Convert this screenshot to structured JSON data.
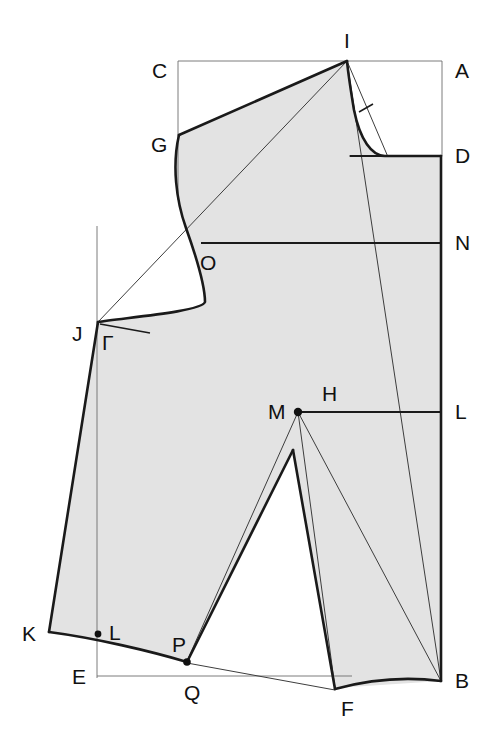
{
  "diagram": {
    "type": "technical-pattern-draft",
    "canvas": {
      "width": 493,
      "height": 741
    },
    "colors": {
      "body_fill": "#e3e3e3",
      "outline": "#1a1a1a",
      "guide": "#6e6e6e",
      "construction": "#3d3d3d",
      "background": "#ffffff"
    },
    "points": [
      {
        "id": "A",
        "label": "A",
        "x": 442,
        "y": 61,
        "label_x": 455,
        "label_y": 78,
        "dot": false
      },
      {
        "id": "B",
        "label": "B",
        "x": 441,
        "y": 681,
        "label_x": 455,
        "label_y": 688,
        "dot": false
      },
      {
        "id": "C",
        "label": "C",
        "x": 178,
        "y": 61,
        "label_x": 152,
        "label_y": 78,
        "dot": false
      },
      {
        "id": "D",
        "label": "D",
        "x": 441,
        "y": 156,
        "label_x": 455,
        "label_y": 163,
        "dot": false
      },
      {
        "id": "E",
        "label": "E",
        "x": 97,
        "y": 676,
        "label_x": 72,
        "label_y": 684,
        "dot": false
      },
      {
        "id": "F",
        "label": "F",
        "x": 335,
        "y": 690,
        "label_x": 341,
        "label_y": 716,
        "dot": false
      },
      {
        "id": "G",
        "label": "G",
        "x": 179,
        "y": 135,
        "label_x": 151,
        "label_y": 152,
        "dot": false
      },
      {
        "id": "H",
        "label": "H",
        "x": 330,
        "y": 394,
        "label_x": 322,
        "label_y": 401,
        "dot": false
      },
      {
        "id": "I",
        "label": "I",
        "x": 347,
        "y": 61,
        "label_x": 344,
        "label_y": 48,
        "dot": false
      },
      {
        "id": "J",
        "label": "J",
        "x": 98,
        "y": 322,
        "label_x": 72,
        "label_y": 341,
        "dot": false
      },
      {
        "id": "K",
        "label": "K",
        "x": 49,
        "y": 632,
        "label_x": 22,
        "label_y": 641,
        "dot": false
      },
      {
        "id": "L_right",
        "label": "L",
        "x": 441,
        "y": 412,
        "label_x": 455,
        "label_y": 419,
        "dot": false
      },
      {
        "id": "L_hem",
        "label": "L",
        "x": 98,
        "y": 634,
        "label_x": 109,
        "label_y": 638,
        "dot": true
      },
      {
        "id": "M",
        "label": "M",
        "x": 298,
        "y": 412,
        "label_x": 268,
        "label_y": 419,
        "dot": true
      },
      {
        "id": "N",
        "label": "N",
        "x": 441,
        "y": 243,
        "label_x": 455,
        "label_y": 250,
        "dot": false
      },
      {
        "id": "O",
        "label": "O",
        "x": 207,
        "y": 255,
        "label_x": 207,
        "label_y": 271,
        "dot": false
      },
      {
        "id": "P",
        "label": "P",
        "x": 187,
        "y": 661,
        "label_x": 174,
        "label_y": 650,
        "dot": true
      },
      {
        "id": "Q",
        "label": "Q",
        "x": 193,
        "y": 676,
        "label_x": 186,
        "label_y": 700,
        "dot": false
      }
    ],
    "angle_markers": [
      {
        "id": "right-angle-at-J",
        "label": "Γ",
        "x": 104,
        "y": 348
      }
    ],
    "construction_lines": [
      {
        "id": "frame-top",
        "from": "C",
        "to": "A"
      },
      {
        "id": "frame-left-C-G",
        "from": "C",
        "to": "G-extended"
      },
      {
        "id": "frame-right-A-D",
        "from": "A",
        "to": "D"
      },
      {
        "id": "vertical-guide-J",
        "from": "above-J",
        "to": "E"
      },
      {
        "id": "baseline-E-F",
        "from": "E",
        "to": "F"
      },
      {
        "id": "diagonal-J-I",
        "from": "J",
        "to": "I"
      },
      {
        "id": "diagonal-I-B",
        "from": "I",
        "to": "B"
      },
      {
        "id": "diagonal-M-B",
        "from": "M",
        "to": "B"
      },
      {
        "id": "dart-guide-M-P",
        "from": "M",
        "to": "P"
      },
      {
        "id": "dart-guide-M-F",
        "from": "M",
        "to": "F"
      },
      {
        "id": "neck-chord-I-D",
        "from": "I",
        "to": "D"
      },
      {
        "id": "hem-guide-P-F",
        "from": "P",
        "to": "F"
      }
    ],
    "horizontal_rules": [
      {
        "id": "rule-N",
        "label": "N",
        "x1": 201,
        "x2": 441,
        "y": 243
      },
      {
        "id": "rule-L",
        "label": "L",
        "x1": 298,
        "x2": 441,
        "y": 412
      },
      {
        "id": "rule-D",
        "label": "D",
        "x1": 350,
        "x2": 441,
        "y": 156
      }
    ]
  }
}
